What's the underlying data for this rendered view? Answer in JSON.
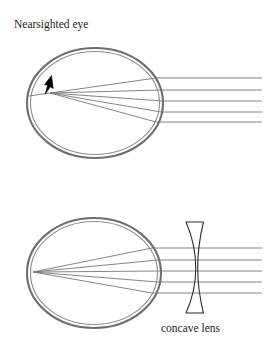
{
  "figure": {
    "title": "Nearsighted eye",
    "lens_label": "concave lens",
    "background_color": "#ffffff",
    "eye_wall_color": "#6e6e6e",
    "eye_inner_color": "#8a8a8a",
    "ray_color": "#777777",
    "lens_outline_color": "#2b2b2b",
    "arrow_color": "#000000"
  },
  "diagrams": [
    {
      "id": "uncorrected-eye",
      "label": "Nearsighted eye",
      "description": "Parallel light rays entering the eye converge to a focal point in front of the retina.",
      "eye": {
        "center_x": 95,
        "center_y": 103,
        "radius_x": 68,
        "radius_y": 55,
        "wall_thickness": 3
      },
      "focal_point": {
        "x": 50,
        "y": 93,
        "on_retina": false
      },
      "marker_arrow": {
        "tip_x": 44,
        "tip_y": 93,
        "tail_x": 51,
        "tail_y": 76
      },
      "ray_count": 5,
      "ray_entry_y": [
        78,
        90,
        101,
        112,
        122
      ],
      "ray_origin_x": 262,
      "has_lens": false
    },
    {
      "id": "corrected-eye",
      "label": "Eye corrected with concave lens",
      "description": "A concave lens diverges the incoming rays so they focus exactly on the retina.",
      "eye": {
        "center_x": 94,
        "center_y": 273,
        "radius_x": 67,
        "radius_y": 55,
        "wall_thickness": 3
      },
      "focal_point": {
        "x": 33,
        "y": 272,
        "on_retina": true
      },
      "ray_count": 5,
      "ray_entry_y": [
        248,
        260,
        271,
        282,
        293
      ],
      "ray_origin_x": 262,
      "has_lens": true,
      "lens": {
        "label": "concave lens",
        "type": "concave",
        "top_y": 222,
        "bottom_y": 313,
        "left_x": 186,
        "right_x": 209
      }
    }
  ]
}
